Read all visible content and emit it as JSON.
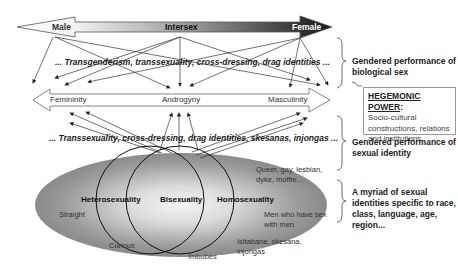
{
  "diagram": {
    "sex_axis": {
      "labels": [
        "Male",
        "Intersex",
        "Female"
      ],
      "gradient_colors": [
        "#ffffff",
        "#1a1a1a"
      ]
    },
    "gender_axis": {
      "labels": [
        "Femininity",
        "Androgyny",
        "Masculinity"
      ]
    },
    "band_top": "... Transgenderism, transsexuality, cross-dressing, drag identities ...",
    "band_middle": "... Transsexuality, cross-dressing, drag identities, skesanas, injongas ...",
    "ellipse": {
      "circles": [
        "Heterosexuality",
        "Bisexuality",
        "Homosexuality"
      ],
      "labels": {
        "straight": "Straight",
        "curious": "Curious",
        "imbubes": "Imbubes",
        "queer_1": "Queer, gay, lesbian,",
        "queer_2": "dyke, moffie...",
        "msm_1": "Men who have sex",
        "msm_2": "with men",
        "isit_1": "Isitabane, skesana,",
        "isit_2": "injongas"
      }
    },
    "side_notes": {
      "biological_1": "Gendered performance of",
      "biological_2": "biological sex",
      "hegemonic_title": "HEGEMONIC POWER",
      "hegemonic_colon": ":",
      "hegemonic_1": "Socio-cultural",
      "hegemonic_2": "constructions, relations",
      "hegemonic_3": "and institutions",
      "sexual_1": "Gendered performance of",
      "sexual_2": "sexual identity",
      "myriad_1": "A myriad of sexual",
      "myriad_2": "identities specific to race,",
      "myriad_3": "class, language, age,",
      "myriad_4": "region..."
    }
  }
}
